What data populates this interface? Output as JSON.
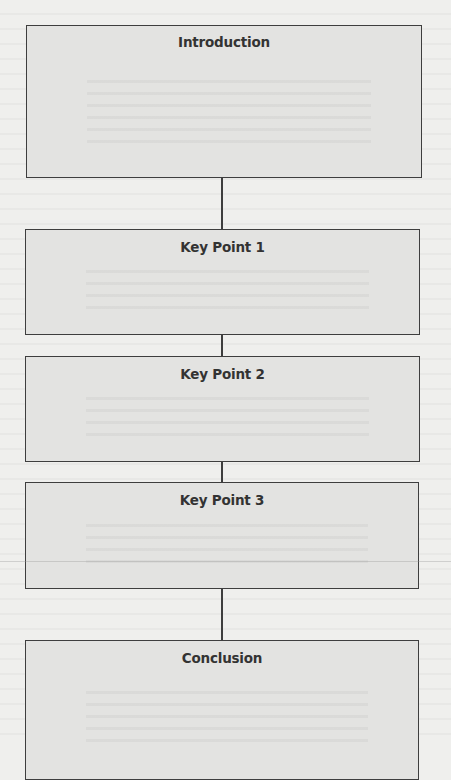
{
  "diagram": {
    "type": "vertical-flowchart",
    "colors": {
      "page_background": "#efefed",
      "box_fill": "#e3e3e1",
      "box_border": "#3e3e3e",
      "title_text": "#333333",
      "connector": "#3e3e3e"
    },
    "boxes": [
      {
        "id": "introduction",
        "title": "Introduction"
      },
      {
        "id": "key-point-1",
        "title": "Key Point 1"
      },
      {
        "id": "key-point-2",
        "title": "Key Point 2"
      },
      {
        "id": "key-point-3",
        "title": "Key Point 3"
      },
      {
        "id": "conclusion",
        "title": "Conclusion"
      }
    ],
    "connections": [
      {
        "from": "introduction",
        "to": "key-point-1"
      },
      {
        "from": "key-point-1",
        "to": "key-point-2"
      },
      {
        "from": "key-point-2",
        "to": "key-point-3"
      },
      {
        "from": "key-point-3",
        "to": "conclusion"
      }
    ]
  }
}
